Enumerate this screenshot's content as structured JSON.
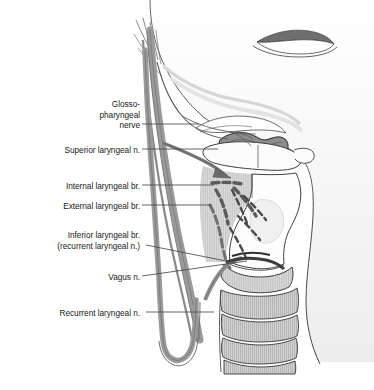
{
  "figure": {
    "background_color": "#ffffff",
    "outline_color": "#3a3a3a",
    "nerve_color": "#8c8c8c",
    "nerve_dark_color": "#6f6f6f",
    "cartilage_fill": "#f2f2f2",
    "cartilage_shade": "#d8d8d8",
    "trachea_fill": "#cfcfcf",
    "mucosa_dark": "#9a9a9a",
    "leader_color": "#4a4a4a"
  },
  "labels": [
    {
      "id": "glossopharyngeal-nerve",
      "lines": [
        "Glosso-",
        "pharyngeal",
        "nerve"
      ],
      "text": "Glosso-\npharyngeal\nnerve",
      "x": 57,
      "y": 99,
      "width": 83,
      "leader": {
        "x1": 142,
        "y1": 124,
        "x2": 196,
        "y2": 124
      }
    },
    {
      "id": "superior-laryngeal-n",
      "lines": [
        "Superior laryngeal n."
      ],
      "text": "Superior laryngeal n.",
      "x": 16,
      "y": 145,
      "width": 124,
      "leader": {
        "x1": 142,
        "y1": 149,
        "x2": 214,
        "y2": 149
      }
    },
    {
      "id": "internal-laryngeal-br",
      "lines": [
        "Internal laryngeal br."
      ],
      "text": "Internal laryngeal br.",
      "x": 17,
      "y": 181,
      "width": 123,
      "leader": {
        "x1": 142,
        "y1": 185,
        "x2": 212,
        "y2": 185
      }
    },
    {
      "id": "external-laryngeal-br",
      "lines": [
        "External laryngeal br."
      ],
      "text": "External laryngeal br.",
      "x": 14,
      "y": 201,
      "width": 126,
      "leader": {
        "x1": 142,
        "y1": 205,
        "x2": 210,
        "y2": 205
      }
    },
    {
      "id": "inferior-laryngeal-br",
      "lines": [
        "Inferior laryngeal br.",
        "(recurrent laryngeal n.)"
      ],
      "text": "Inferior laryngeal br.\n(recurrent laryngeal n.)",
      "x": 10,
      "y": 230,
      "width": 130,
      "leader": {
        "x1": 145,
        "y1": 245,
        "x2": 233,
        "y2": 262
      }
    },
    {
      "id": "vagus-n",
      "lines": [
        "Vagus n."
      ],
      "text": "Vagus n.",
      "x": 85,
      "y": 272,
      "width": 55,
      "leader": {
        "x1": 142,
        "y1": 276,
        "x2": 245,
        "y2": 262
      }
    },
    {
      "id": "recurrent-laryngeal-n",
      "lines": [
        "Recurrent laryngeal n."
      ],
      "text": "Recurrent laryngeal n.",
      "x": 12,
      "y": 308,
      "width": 128,
      "leader": {
        "x1": 145,
        "y1": 312,
        "x2": 213,
        "y2": 312
      }
    }
  ],
  "caption": {
    "text": "",
    "visible_note": "bottom caption row is clipped — only letter-tops visible, illegible"
  }
}
